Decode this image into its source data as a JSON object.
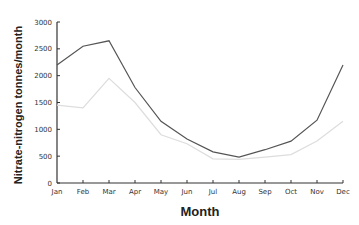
{
  "chart_data": {
    "type": "line",
    "title": "",
    "xlabel": "Month",
    "ylabel": "Nitrate-nitrogen tonnes/month",
    "categories": [
      "Jan",
      "Feb",
      "Mar",
      "Apr",
      "May",
      "Jun",
      "Jul",
      "Aug",
      "Sep",
      "Oct",
      "Nov",
      "Dec"
    ],
    "yticks": [
      0,
      500,
      1000,
      1500,
      2000,
      2500,
      3000
    ],
    "ylim": [
      0,
      3000
    ],
    "grid": false,
    "legend": null,
    "series": [
      {
        "name": "Series 1 (dark)",
        "color": "#555555",
        "values": [
          2200,
          2550,
          2650,
          1780,
          1150,
          820,
          580,
          480,
          620,
          780,
          1170,
          2200
        ]
      },
      {
        "name": "Series 2 (light)",
        "color": "#dddddd",
        "values": [
          1450,
          1400,
          1950,
          1500,
          900,
          730,
          450,
          440,
          480,
          530,
          780,
          1150
        ]
      }
    ]
  }
}
